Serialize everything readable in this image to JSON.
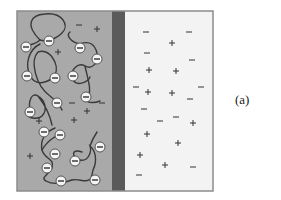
{
  "figure": {
    "label": "(a)",
    "colors": {
      "left_compartment": "#a9a9a9",
      "right_compartment": "#f3f3f3",
      "membrane": "#5a5a5a",
      "border": "#8c8c8c",
      "chain": "#3a3a3a",
      "charge_bead_fill": "#f5f5f5",
      "charge_bead_stroke": "#555555",
      "ion": "#333333"
    },
    "box": {
      "x": 17,
      "y": 11,
      "width": 196,
      "height": 180
    },
    "membrane": {
      "x": 112,
      "width": 13
    },
    "left_compartment": {
      "description": "polyelectrolyte solution with counterions",
      "polymer_chains": [
        {
          "path": "M40,40 C25,25 30,15 45,14 C62,12 70,25 62,33 C55,40 45,42 40,40 M40,40 C35,45 28,44 26,47"
        },
        {
          "path": "M40,44 C28,50 25,65 30,75 C35,88 50,82 55,75 C60,65 50,48 38,52 C30,60 35,85 50,96 C55,100 60,105 62,110"
        },
        {
          "path": "M80,44 C70,42 66,35 70,32 M80,44 C90,40 95,45 97,53 C100,62 92,70 85,66 C78,62 70,70 72,78 C76,88 88,82 90,77"
        },
        {
          "path": "M85,66 C88,80 92,90 88,100 C86,102 92,104 100,101"
        },
        {
          "path": "M30,112 C28,100 32,92 38,96 C45,100 48,110 42,116 C38,120 30,118 28,116 M38,96 C45,105 50,115 52,125"
        },
        {
          "path": "M55,128 C45,132 40,140 42,150 C45,160 55,158 52,168 C48,175 40,178 46,181 C55,186 65,182 72,180 C80,178 85,184 92,178"
        },
        {
          "path": "M42,150 C48,140 56,135 62,135"
        },
        {
          "path": "M82,152 C70,148 72,158 80,160 C88,162 92,152 90,146 C95,150 98,160 93,170 C92,176 90,180 92,178 M90,146 C92,140 95,135 97,132"
        }
      ],
      "charged_beads": [
        {
          "x": 26,
          "y": 47
        },
        {
          "x": 49,
          "y": 41
        },
        {
          "x": 80,
          "y": 48
        },
        {
          "x": 97,
          "y": 59
        },
        {
          "x": 27,
          "y": 76
        },
        {
          "x": 55,
          "y": 78
        },
        {
          "x": 73,
          "y": 76
        },
        {
          "x": 86,
          "y": 97
        },
        {
          "x": 57,
          "y": 103
        },
        {
          "x": 30,
          "y": 112
        },
        {
          "x": 44,
          "y": 132
        },
        {
          "x": 55,
          "y": 154
        },
        {
          "x": 47,
          "y": 168
        },
        {
          "x": 61,
          "y": 181
        },
        {
          "x": 75,
          "y": 161
        },
        {
          "x": 100,
          "y": 147
        },
        {
          "x": 95,
          "y": 180
        },
        {
          "x": 60,
          "y": 135
        }
      ],
      "free_ions": [
        {
          "sign": "−",
          "x": 79,
          "y": 25
        },
        {
          "sign": "+",
          "x": 97,
          "y": 29
        },
        {
          "sign": "+",
          "x": 58,
          "y": 52
        },
        {
          "sign": "−",
          "x": 72,
          "y": 103
        },
        {
          "sign": "−",
          "x": 102,
          "y": 103
        },
        {
          "sign": "+",
          "x": 87,
          "y": 111
        },
        {
          "sign": "+",
          "x": 74,
          "y": 120
        },
        {
          "sign": "+",
          "x": 39,
          "y": 121
        },
        {
          "sign": "+",
          "x": 30,
          "y": 156
        }
      ]
    },
    "right_compartment": {
      "description": "salt solution",
      "free_ions": [
        {
          "sign": "−",
          "x": 146,
          "y": 32
        },
        {
          "sign": "−",
          "x": 189,
          "y": 32
        },
        {
          "sign": "+",
          "x": 172,
          "y": 43
        },
        {
          "sign": "−",
          "x": 147,
          "y": 53
        },
        {
          "sign": "−",
          "x": 192,
          "y": 60
        },
        {
          "sign": "+",
          "x": 149,
          "y": 70
        },
        {
          "sign": "+",
          "x": 176,
          "y": 71
        },
        {
          "sign": "−",
          "x": 136,
          "y": 87
        },
        {
          "sign": "−",
          "x": 201,
          "y": 87
        },
        {
          "sign": "+",
          "x": 148,
          "y": 92
        },
        {
          "sign": "+",
          "x": 172,
          "y": 93
        },
        {
          "sign": "−",
          "x": 190,
          "y": 99
        },
        {
          "sign": "−",
          "x": 144,
          "y": 109
        },
        {
          "sign": "−",
          "x": 176,
          "y": 117
        },
        {
          "sign": "−",
          "x": 160,
          "y": 121
        },
        {
          "sign": "+",
          "x": 193,
          "y": 123
        },
        {
          "sign": "+",
          "x": 147,
          "y": 134
        },
        {
          "sign": "+",
          "x": 178,
          "y": 143
        },
        {
          "sign": "+",
          "x": 140,
          "y": 155
        },
        {
          "sign": "+",
          "x": 165,
          "y": 165
        },
        {
          "sign": "−",
          "x": 193,
          "y": 167
        },
        {
          "sign": "−",
          "x": 139,
          "y": 175
        }
      ]
    }
  }
}
